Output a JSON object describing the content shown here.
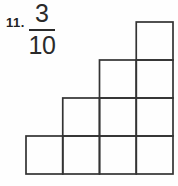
{
  "problem": {
    "number": "11.",
    "fraction": {
      "numerator": "3",
      "denominator": "10"
    }
  },
  "figure": {
    "type": "staircase-grid",
    "total_squares": 10,
    "rows_top_to_bottom": [
      1,
      2,
      3,
      4
    ],
    "alignment": "right",
    "line_color": "#333333"
  }
}
